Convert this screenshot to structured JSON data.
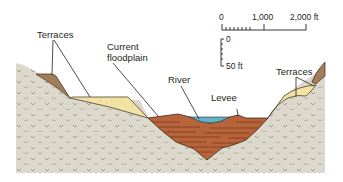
{
  "diagram": {
    "type": "cross-section",
    "labels": {
      "terraces_left": "Terraces",
      "current_floodplain_line1": "Current",
      "current_floodplain_line2": "floodplain",
      "river": "River",
      "levee": "Levee",
      "terraces_right": "Terraces"
    },
    "scale": {
      "horizontal": {
        "ticks": [
          "0",
          "1,000",
          "2,000 ft"
        ]
      },
      "vertical": {
        "ticks": [
          "0",
          "50 ft"
        ]
      }
    },
    "colors": {
      "bedrock": "#ddd8cc",
      "bedrock_pattern": "#8f8a80",
      "old_terrace": "#a37d58",
      "young_terrace": "#f1e3a3",
      "floodplain_fill": "#b8643a",
      "floodplain_lines": "#7a3a1c",
      "river_water": "#5fb3cc",
      "outline": "#3a2a1e"
    }
  }
}
